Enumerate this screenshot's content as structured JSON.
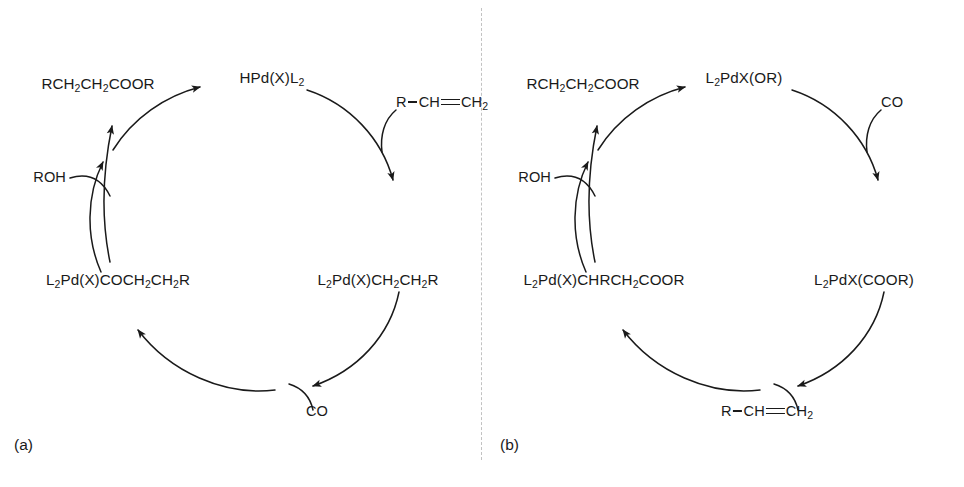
{
  "figure": {
    "panels": [
      {
        "id": "a",
        "panel_label": "(a)",
        "species": {
          "top_left": {
            "pre": "RCH",
            "sub1": "2",
            "mid": "CH",
            "sub2": "2",
            "post": "COOR"
          },
          "top_right": {
            "pre": "HPd(X)L",
            "sub1": "2",
            "mid": "",
            "sub2": "",
            "post": ""
          },
          "bottom_left": {
            "pre": "L",
            "sub1": "2",
            "mid": "Pd(X)COCH",
            "sub2": "2",
            "post": "CH",
            "sub3": "2",
            "tail": "R"
          },
          "bottom_right": {
            "pre": "L",
            "sub1": "2",
            "mid": "Pd(X)CH",
            "sub2": "2",
            "post": "CH",
            "sub3": "2",
            "tail": "R"
          }
        },
        "reagents": {
          "alcohol": "ROH",
          "carbon_monoxide": "CO",
          "alkene": {
            "r": "R",
            "ch": "CH",
            "ch2": "CH",
            "ch2_sub": "2"
          }
        }
      },
      {
        "id": "b",
        "panel_label": "(b)",
        "species": {
          "top_left": {
            "pre": "RCH",
            "sub1": "2",
            "mid": "CH",
            "sub2": "2",
            "post": "COOR"
          },
          "top_right": {
            "pre": "L",
            "sub1": "2",
            "mid": "PdX(OR)",
            "sub2": "",
            "post": ""
          },
          "bottom_left": {
            "pre": "L",
            "sub1": "2",
            "mid": "Pd(X)CHRCH",
            "sub2": "2",
            "post": "COOR"
          },
          "bottom_right": {
            "pre": "L",
            "sub1": "2",
            "mid": "PdX(COOR)",
            "sub2": "",
            "post": ""
          }
        },
        "reagents": {
          "alcohol": "ROH",
          "carbon_monoxide": "CO",
          "alkene": {
            "r": "R",
            "ch": "CH",
            "ch2": "CH",
            "ch2_sub": "2"
          }
        }
      }
    ],
    "colors": {
      "ink": "#1a1a1a",
      "divider": "#c2c2c2",
      "background": "#ffffff"
    }
  }
}
